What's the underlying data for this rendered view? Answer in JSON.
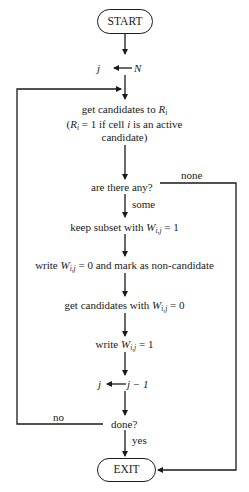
{
  "flowchart": {
    "start": "START",
    "init": {
      "lhs": "j",
      "rhs": "N"
    },
    "get_candidates": {
      "line1_prefix": "get candidates to ",
      "line1_var": "R",
      "line1_sub": "i",
      "line2_open": "(",
      "line2_var": "R",
      "line2_sub": "i",
      "line2_mid": " = 1 if cell ",
      "line2_i": "i",
      "line2_end": " is an active",
      "line3": "candidate)"
    },
    "decision_any": "are there any?",
    "label_none": "none",
    "label_some": "some",
    "keep_subset": {
      "prefix": "keep subset with ",
      "var": "W",
      "sub": "i,j",
      "suffix": " = 1"
    },
    "write_zero": {
      "prefix": "write ",
      "var": "W",
      "sub": "i,j",
      "suffix": " = 0 and mark as non-candidate"
    },
    "get_zero": {
      "prefix": "get candidates with ",
      "var": "W",
      "sub": "i,j",
      "suffix": " = 0"
    },
    "write_one": {
      "prefix": "write ",
      "var": "W",
      "sub": "i,j",
      "suffix": " = 1"
    },
    "decrement": {
      "lhs": "j",
      "rhs": "j − 1"
    },
    "decision_done": "done?",
    "label_no": "no",
    "label_yes": "yes",
    "exit": "EXIT"
  }
}
